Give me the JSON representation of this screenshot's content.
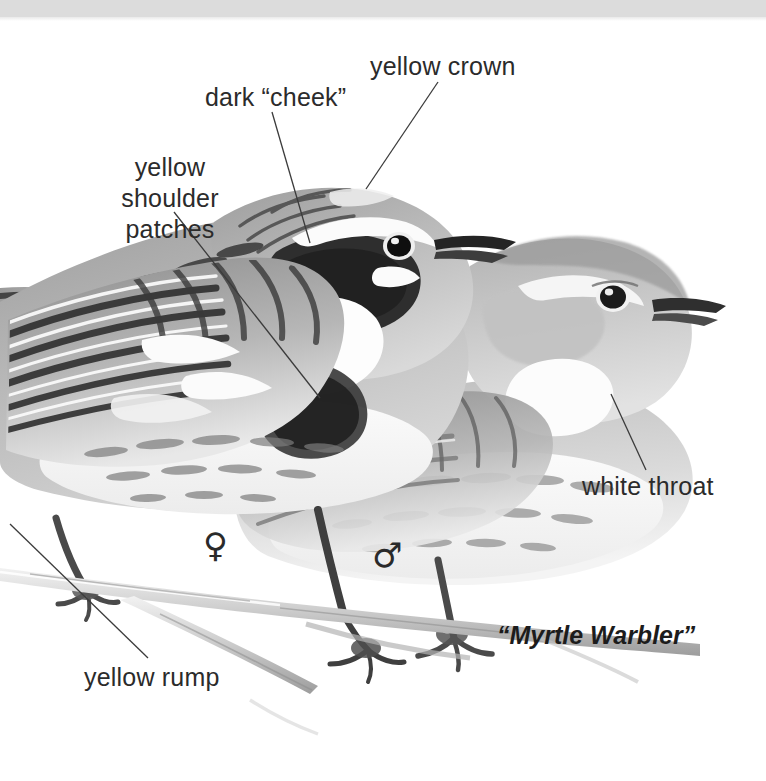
{
  "plate": {
    "title": "Myrtle Warbler field guide plate",
    "background_color": "#ffffff",
    "top_band_color": "#dcdcdc",
    "ink_color": "#2b2b2b",
    "caption": "“Myrtle Warbler”"
  },
  "labels": [
    {
      "id": "yellow-crown",
      "text": "yellow crown",
      "x": 370,
      "y": 52,
      "leader": [
        438,
        82,
        366,
        189
      ]
    },
    {
      "id": "dark-cheek",
      "text": "dark “cheek”",
      "x": 205,
      "y": 83,
      "leader": [
        272,
        112,
        310,
        243
      ]
    },
    {
      "id": "yellow-shoulder-patches",
      "text": "yellow shoulder\npatches",
      "x": 84,
      "y": 152,
      "leader": [
        174,
        212,
        320,
        398
      ]
    },
    {
      "id": "white-throat",
      "text": "white throat",
      "x": 582,
      "y": 472,
      "leader": [
        646,
        470,
        611,
        394
      ]
    },
    {
      "id": "yellow-rump",
      "text": "yellow rump",
      "x": 84,
      "y": 663,
      "leader": [
        148,
        658,
        10,
        524
      ]
    }
  ],
  "sex_symbols": [
    {
      "id": "female-symbol",
      "glyph": "♀",
      "meaning": "female",
      "x": 203,
      "y": 528
    },
    {
      "id": "male-symbol",
      "glyph": "♂",
      "meaning": "male",
      "x": 372,
      "y": 538
    }
  ],
  "subjects": [
    {
      "id": "male-warbler",
      "description": "male Myrtle Warbler in front, dark cheek patch, white throat, streaked flanks"
    },
    {
      "id": "female-warbler",
      "description": "female Myrtle Warbler behind, duller plumage, pale face"
    },
    {
      "id": "perch-branch",
      "description": "twig branch both birds grip"
    }
  ]
}
